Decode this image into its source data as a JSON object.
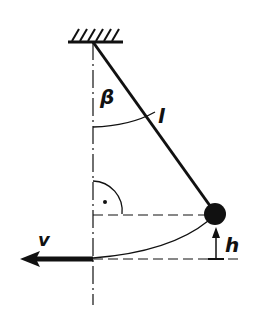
{
  "diagram": {
    "labels": {
      "angle": "β",
      "length": "l",
      "height": "h",
      "velocity": "v"
    },
    "colors": {
      "ink": "#111111",
      "background": "#ffffff"
    },
    "elements": [
      "ceiling-support",
      "pendulum-string",
      "pendulum-bob",
      "vertical-centerline",
      "angle-arc-beta",
      "right-angle-marker",
      "horizontal-dashed-line-bob",
      "horizontal-dashed-line-bottom",
      "swing-arc-path",
      "height-arrow",
      "velocity-arrow"
    ]
  }
}
